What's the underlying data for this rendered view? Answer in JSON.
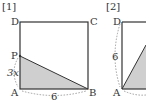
{
  "figures": [
    {
      "id": "fig1",
      "label": "[1]",
      "vertices": {
        "A": "A",
        "B": "B",
        "C": "C",
        "D": "D",
        "P": "P"
      },
      "dimension_labels": {
        "AP": "3x",
        "AB": "6"
      },
      "shaded_region": "triangle PAB"
    },
    {
      "id": "fig2",
      "label": "[2]",
      "vertices": {
        "A": "A",
        "D": "D"
      },
      "dimension_labels": {
        "AD": "6"
      },
      "shaded_region": "triangle from A"
    }
  ],
  "colors": {
    "stroke": "#333333",
    "shade": "#cfcfcf",
    "dashed": "#888888"
  }
}
